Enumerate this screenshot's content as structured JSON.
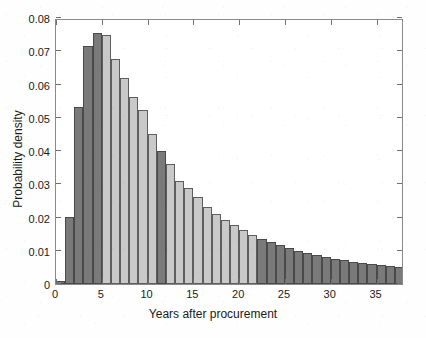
{
  "chart_data": {
    "type": "bar",
    "title": "",
    "subtitle": "",
    "xlabel": "Years after procurement",
    "ylabel": "Probability density",
    "xlim": [
      0,
      38
    ],
    "ylim": [
      0,
      0.08
    ],
    "grid": false,
    "legend": null,
    "bar_width": 1,
    "xticks": [
      0,
      5,
      10,
      15,
      20,
      25,
      30,
      35
    ],
    "xtick_labels": [
      "0",
      "5",
      "10",
      "15",
      "20",
      "25",
      "30",
      "35"
    ],
    "xticks_minor": [
      1,
      2,
      3,
      4,
      6,
      7,
      8,
      9,
      11,
      12,
      13,
      14,
      16,
      17,
      18,
      19,
      21,
      22,
      23,
      24,
      26,
      27,
      28,
      29,
      31,
      32,
      33,
      34,
      36,
      37,
      38
    ],
    "yticks": [
      0,
      0.01,
      0.02,
      0.03,
      0.04,
      0.05,
      0.06,
      0.07,
      0.08
    ],
    "ytick_labels": [
      "0",
      "0.01",
      "0.02",
      "0.03",
      "0.04",
      "0.05",
      "0.06",
      "0.07",
      "0.08"
    ],
    "colors": {
      "dark_bar": "#7a7a7a",
      "light_bar": "#c9c9c9",
      "bar_edge": "#5d5d5d",
      "axis": "#8a8a8a",
      "text": "#1a1a1a",
      "background": "#ffffff"
    },
    "categories": [
      "0-1",
      "1-2",
      "2-3",
      "3-4",
      "4-5",
      "5-6",
      "6-7",
      "7-8",
      "8-9",
      "9-10",
      "10-11",
      "11-12",
      "12-13",
      "13-14",
      "14-15",
      "15-16",
      "16-17",
      "17-18",
      "18-19",
      "19-20",
      "20-21",
      "21-22",
      "22-23",
      "23-24",
      "24-25",
      "25-26",
      "26-27",
      "27-28",
      "28-29",
      "29-30",
      "30-31",
      "31-32",
      "32-33",
      "33-34",
      "34-35",
      "35-36",
      "36-37",
      "37-38"
    ],
    "bin_starts": [
      0,
      1,
      2,
      3,
      4,
      5,
      6,
      7,
      8,
      9,
      10,
      11,
      12,
      13,
      14,
      15,
      16,
      17,
      18,
      19,
      20,
      21,
      22,
      23,
      24,
      25,
      26,
      27,
      28,
      29,
      30,
      31,
      32,
      33,
      34,
      35,
      36,
      37
    ],
    "values": [
      0.001,
      0.0203,
      0.0533,
      0.0715,
      0.0755,
      0.075,
      0.0676,
      0.0621,
      0.0561,
      0.0522,
      0.0452,
      0.0399,
      0.0362,
      0.0311,
      0.029,
      0.0261,
      0.0231,
      0.0212,
      0.0193,
      0.0176,
      0.0161,
      0.0148,
      0.0136,
      0.0125,
      0.0116,
      0.0107,
      0.01,
      0.0093,
      0.0087,
      0.0081,
      0.0076,
      0.0071,
      0.0067,
      0.0063,
      0.0059,
      0.0056,
      0.0053,
      0.005
    ],
    "bar_shades": [
      "dark",
      "dark",
      "dark",
      "dark",
      "dark",
      "light",
      "light",
      "light",
      "light",
      "light",
      "light",
      "dark",
      "light",
      "light",
      "light",
      "light",
      "light",
      "light",
      "light",
      "light",
      "light",
      "light",
      "dark",
      "dark",
      "dark",
      "dark",
      "dark",
      "dark",
      "dark",
      "dark",
      "dark",
      "dark",
      "dark",
      "dark",
      "dark",
      "dark",
      "dark",
      "dark"
    ],
    "annotations": []
  }
}
